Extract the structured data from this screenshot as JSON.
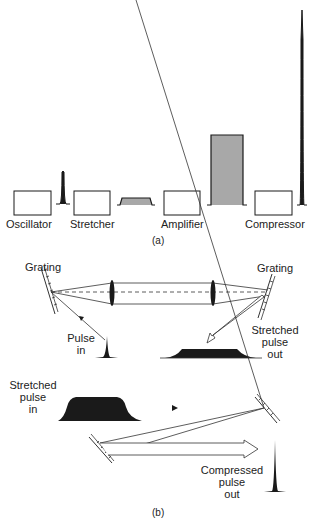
{
  "panel_a": {
    "caption": "(a)",
    "stages": [
      {
        "label": "Oscillator"
      },
      {
        "label": "Stretcher"
      },
      {
        "label": "Amplifier"
      },
      {
        "label": "Compressor"
      }
    ],
    "pulses": [
      {
        "name": "oscillator-output-pulse",
        "shape": "short-spike"
      },
      {
        "name": "stretched-pulse",
        "shape": "low-flat-top",
        "fill": "#a8a8a8"
      },
      {
        "name": "amplified-pulse",
        "shape": "tall-flat-top",
        "fill": "#a8a8a8"
      },
      {
        "name": "compressed-pulse",
        "shape": "very-tall-spike"
      }
    ]
  },
  "panel_b": {
    "caption": "(b)",
    "stretcher": {
      "grating_left_label": "Grating",
      "grating_right_label": "Grating",
      "pulse_in_label_line1": "Pulse",
      "pulse_in_label_line2": "in",
      "pulse_out_label_line1": "Stretched",
      "pulse_out_label_line2": "pulse",
      "pulse_out_label_line3": "out"
    },
    "compressor": {
      "pulse_in_label_line1": "Stretched",
      "pulse_in_label_line2": "pulse",
      "pulse_in_label_line3": "in",
      "pulse_out_label_line1": "Compressed",
      "pulse_out_label_line2": "pulse",
      "pulse_out_label_line3": "out"
    }
  }
}
